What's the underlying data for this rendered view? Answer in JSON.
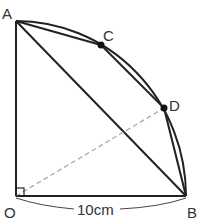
{
  "diagram": {
    "points": {
      "A": {
        "label": "A",
        "x": 16,
        "y": 21
      },
      "B": {
        "label": "B",
        "x": 186,
        "y": 196
      },
      "O": {
        "label": "O",
        "x": 16,
        "y": 196
      },
      "C": {
        "label": "C",
        "x": 101,
        "y": 45
      },
      "D": {
        "label": "D",
        "x": 164,
        "y": 108
      }
    },
    "measurement": {
      "label": "10cm",
      "segment": "OB"
    },
    "colors": {
      "stroke": "#222222",
      "dashed": "#aaaaaa",
      "label": "#333333"
    }
  }
}
